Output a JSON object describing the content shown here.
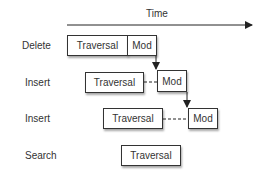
{
  "diagram": {
    "axis": {
      "label": "Time"
    },
    "rows": [
      {
        "label": "Delete",
        "traversal": "Traversal",
        "mod": "Mod"
      },
      {
        "label": "Insert",
        "traversal": "Traversal",
        "mod": "Mod"
      },
      {
        "label": "Insert",
        "traversal": "Traversal",
        "mod": "Mod"
      },
      {
        "label": "Search",
        "traversal": "Traversal"
      }
    ]
  }
}
